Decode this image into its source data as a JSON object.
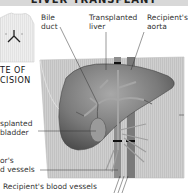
{
  "title": "LIVER TRANSPLANT",
  "labels": {
    "bile_duct": [
      "Bile",
      "duct"
    ],
    "transplanted_liver": [
      "Transplanted",
      "liver"
    ],
    "recipients_aorta": [
      "Recipient's",
      "aorta"
    ],
    "site_of_incision": [
      "TE OF",
      "CISION"
    ],
    "transplanted_gallbladder": [
      "splanted",
      "bladder"
    ],
    "donors_blood_vessels": [
      "or's",
      "d vessels"
    ],
    "recipients_blood_vessels": "Recipient's blood vessels"
  },
  "colors": {
    "background_panel": "#c9c9c9",
    "liver": "#6e6e6e",
    "liver_highlight": "#9a9a9a",
    "vessels": "#8a8a8a",
    "body_outline": "#e4e4e4"
  }
}
